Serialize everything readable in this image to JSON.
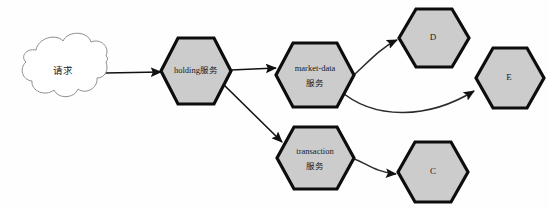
{
  "diagram": {
    "background_color": "#fefefe",
    "node_fill_color": "#cccccc",
    "node_stroke_color": "#0d0d0d",
    "edge_color": "#111111",
    "cloud_stroke_color": "#8e8e8e",
    "nodes": [
      {
        "id": "request",
        "label": "请求",
        "shape": "cloud",
        "x": 63,
        "y": 72
      },
      {
        "id": "holding",
        "label": "holding服务",
        "shape": "hexagon",
        "x": 196,
        "y": 71
      },
      {
        "id": "market-data",
        "label_line1": "market-data",
        "label_line2": "服务",
        "shape": "hexagon",
        "x": 315,
        "y": 75
      },
      {
        "id": "transaction",
        "label_line1": "transaction",
        "label_line2": "服务",
        "shape": "hexagon",
        "x": 315,
        "y": 158
      },
      {
        "id": "d",
        "label": "D",
        "shape": "hexagon",
        "x": 432,
        "y": 38
      },
      {
        "id": "e",
        "label": "E",
        "shape": "hexagon",
        "x": 508,
        "y": 78
      },
      {
        "id": "c",
        "label": "C",
        "shape": "hexagon",
        "x": 432,
        "y": 172
      }
    ],
    "edges": [
      {
        "id": "request-to-holding",
        "from": "request",
        "to": "holding",
        "style": "straight",
        "arrow": true
      },
      {
        "id": "holding-to-market-data",
        "from": "holding",
        "to": "market-data",
        "style": "straight",
        "arrow": true
      },
      {
        "id": "holding-to-transaction",
        "from": "holding",
        "to": "transaction",
        "style": "straight",
        "arrow": true
      },
      {
        "id": "market-data-to-d",
        "from": "market-data",
        "to": "d",
        "style": "curved",
        "arrow": true
      },
      {
        "id": "market-data-to-e",
        "from": "market-data",
        "to": "e",
        "style": "curved",
        "arrow": true
      },
      {
        "id": "transaction-to-c",
        "from": "transaction",
        "to": "c",
        "style": "curved",
        "arrow": true
      }
    ]
  }
}
